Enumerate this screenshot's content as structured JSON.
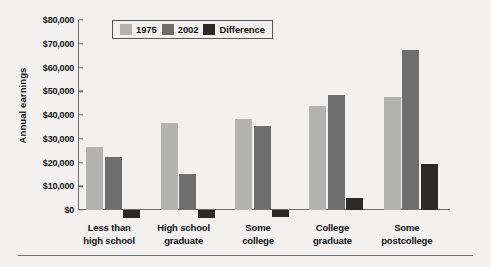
{
  "chart_data": {
    "type": "bar",
    "title": "",
    "xlabel": "",
    "ylabel": "Annual earnings",
    "ylim": [
      -10000,
      80000
    ],
    "grid": false,
    "legend_position": "top-left-inside",
    "ytick_labels": [
      "$80,000",
      "$70,000",
      "$60,000",
      "$50,000",
      "$40,000",
      "$30,000",
      "$20,000",
      "$10,000",
      "$0"
    ],
    "ytick_values": [
      80000,
      70000,
      60000,
      50000,
      40000,
      30000,
      20000,
      10000,
      0
    ],
    "categories": [
      "Less than\nhigh school",
      "High school\ngraduate",
      "Some\ncollege",
      "College\ngraduate",
      "Some\npostcollege"
    ],
    "category_lines": [
      [
        "Less than",
        "high school"
      ],
      [
        "High school",
        "graduate"
      ],
      [
        "Some",
        "college"
      ],
      [
        "College",
        "graduate"
      ],
      [
        "Some",
        "postcollege"
      ]
    ],
    "series": [
      {
        "name": "1975",
        "color": "#b3b3b1",
        "values": [
          26500,
          36500,
          38500,
          44000,
          47500
        ]
      },
      {
        "name": "2002",
        "color": "#6e6e6e",
        "values": [
          22500,
          15000,
          35500,
          48500,
          67500
        ]
      },
      {
        "name": "Difference",
        "color": "#2b2a28",
        "values": [
          -3500,
          -3500,
          -3000,
          5000,
          19500
        ]
      }
    ]
  },
  "colors": {
    "background": "#f2f1ef",
    "axis": "#6c6c6c",
    "text": "#111111",
    "series_1975": "#b3b3b1",
    "series_2002": "#6e6e6e",
    "series_difference": "#2b2a28",
    "rule": "#6f7072"
  }
}
